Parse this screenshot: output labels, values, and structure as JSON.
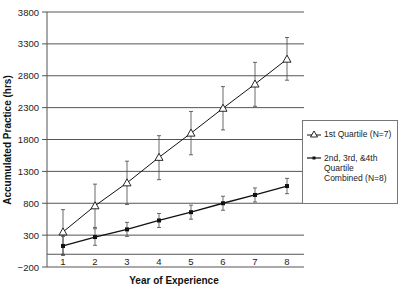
{
  "chart_data": {
    "type": "line",
    "title": "",
    "xlabel": "Year of Experience",
    "ylabel": "Accumulated Practice (hrs)",
    "x": [
      1,
      2,
      3,
      4,
      5,
      6,
      7,
      8
    ],
    "x_tick_labels": [
      "1",
      "2",
      "3",
      "4",
      "5",
      "6",
      "7",
      "8"
    ],
    "y_tick_labels": [
      "3800",
      "3300",
      "2800",
      "2300",
      "1800",
      "1300",
      "800",
      "300",
      "−200"
    ],
    "yticks": [
      3800,
      3300,
      2800,
      2300,
      1800,
      1300,
      800,
      300,
      -200
    ],
    "ylim": [
      -200,
      3800
    ],
    "grid": "horizontal",
    "legend_position": "right",
    "error_bars": true,
    "series": [
      {
        "name": "1st Quartile (N=7)",
        "marker": "open-triangle",
        "values": [
          350,
          760,
          1120,
          1520,
          1900,
          2290,
          2670,
          3060
        ],
        "error_low": [
          0,
          420,
          780,
          1170,
          1560,
          1950,
          2320,
          2730
        ],
        "error_high": [
          700,
          1100,
          1460,
          1860,
          2240,
          2630,
          3010,
          3400
        ]
      },
      {
        "name": "2nd, 3rd, &4th Quartile Combined (N=8)",
        "marker": "filled-circle",
        "values": [
          130,
          270,
          390,
          530,
          660,
          800,
          930,
          1070
        ],
        "error_low": [
          -20,
          140,
          280,
          420,
          550,
          690,
          820,
          950
        ],
        "error_high": [
          280,
          400,
          500,
          640,
          770,
          910,
          1040,
          1190
        ]
      }
    ]
  },
  "legend": {
    "item1": "1st Quartile (N=7)",
    "item2": "2nd, 3rd, &4th Quartile Combined (N=8)"
  },
  "axes": {
    "xlabel": "Year of Experience",
    "ylabel": "Accumulated Practice (hrs)"
  }
}
